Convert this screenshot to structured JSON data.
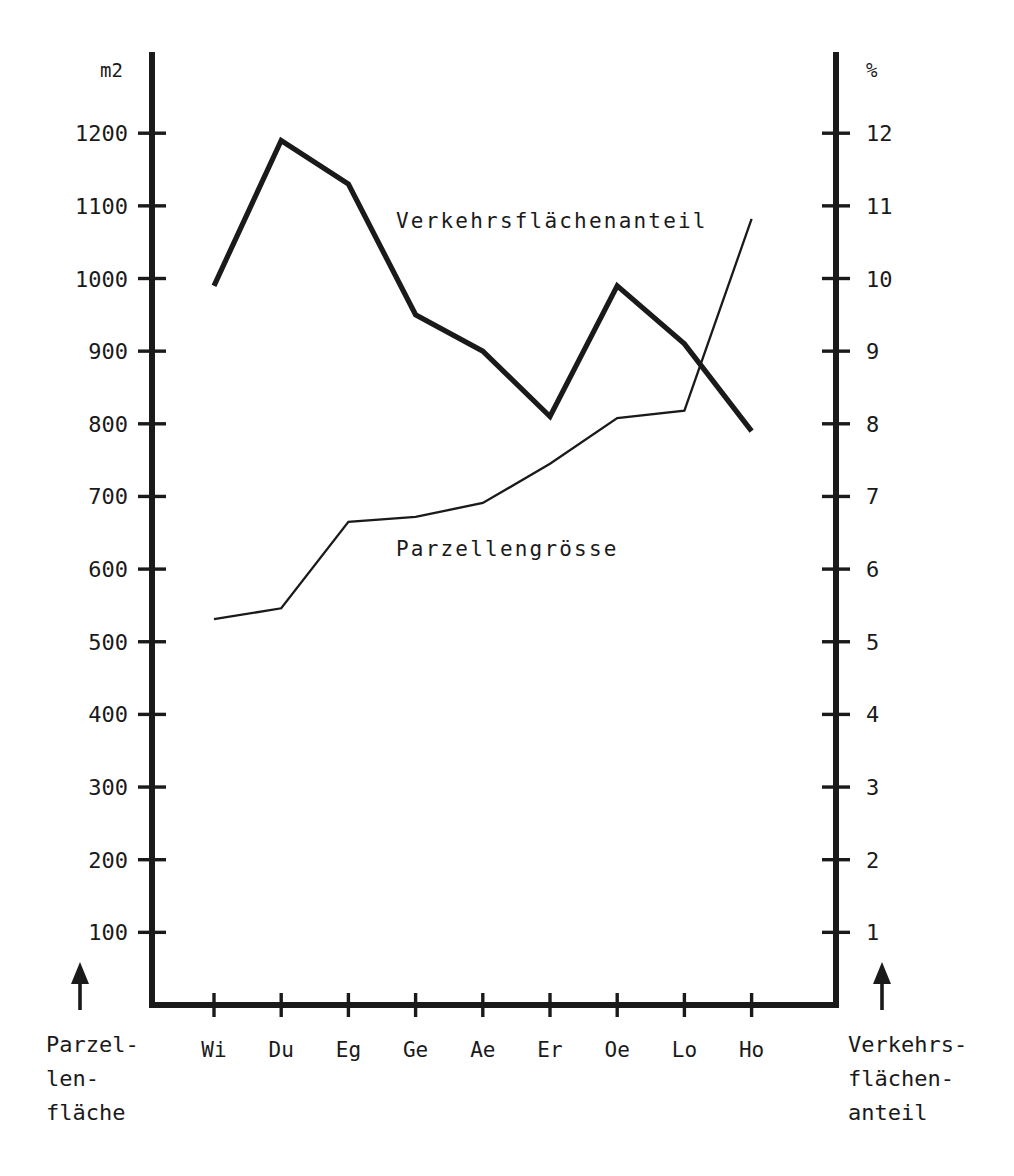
{
  "chart_data": {
    "type": "line",
    "title": "",
    "categories": [
      "Wi",
      "Du",
      "Eg",
      "Ge",
      "Ae",
      "Er",
      "Oe",
      "Lo",
      "Ho"
    ],
    "grid": false,
    "legend_position": "inline-annotation",
    "axes": {
      "left": {
        "unit": "m2",
        "label": "Parzellenfläche",
        "ticks": [
          100,
          200,
          300,
          400,
          500,
          600,
          700,
          800,
          900,
          1000,
          1100,
          1200
        ],
        "tick_labels": [
          "100",
          "200",
          "300",
          "400",
          "500",
          "600",
          "700",
          "800",
          "900",
          "1000",
          "1100",
          "1200"
        ],
        "lim": [
          0,
          1250
        ]
      },
      "right": {
        "unit": "%",
        "label": "Verkehrsflächenanteil",
        "ticks": [
          1,
          2,
          3,
          4,
          5,
          6,
          7,
          8,
          9,
          10,
          11,
          12
        ],
        "tick_labels": [
          "1",
          "2",
          "3",
          "4",
          "5",
          "6",
          "7",
          "8",
          "9",
          "10",
          "11",
          "12"
        ],
        "lim": [
          0,
          12.5
        ]
      }
    },
    "series": [
      {
        "name": "Verkehrsflächenanteil",
        "axis": "right",
        "unit": "%",
        "style": "thick",
        "values": [
          9.9,
          11.9,
          11.3,
          9.5,
          9.0,
          8.1,
          9.9,
          9.1,
          7.9
        ]
      },
      {
        "name": "Parzellengrösse",
        "axis": "left",
        "unit": "m2",
        "style": "thin",
        "values": [
          531,
          546,
          665,
          672,
          691,
          745,
          808,
          818,
          1082
        ]
      }
    ],
    "annotations": [
      {
        "text": "Verkehrsflächenanteil",
        "x": 396,
        "y": 228
      },
      {
        "text": "Parzellengrösse",
        "x": 396,
        "y": 556
      }
    ]
  },
  "axis_units": {
    "left": "m2",
    "right": "%"
  },
  "corner_labels": {
    "left": [
      "Parzel-",
      "len-",
      "fläche"
    ],
    "right": [
      "Verkehrs-",
      "flächen-",
      "anteil"
    ]
  },
  "icons": {
    "left_arrow": "arrow-up-icon",
    "right_arrow": "arrow-up-icon"
  }
}
